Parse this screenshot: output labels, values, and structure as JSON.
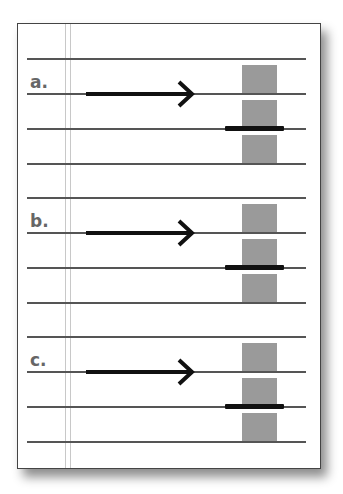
{
  "diagram": {
    "colors": {
      "rule": "#555555",
      "margin": "#c8c8c8",
      "box": "#9a9a9a",
      "ink": "#111111",
      "label": "#666666"
    },
    "sections": [
      {
        "label": "a."
      },
      {
        "label": "b."
      },
      {
        "label": "c."
      }
    ]
  }
}
